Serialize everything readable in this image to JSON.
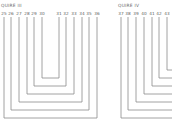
{
  "diagram": {
    "colors": {
      "line": "#8c8c8c",
      "text": "#5e5e5e",
      "background": "#ffffff"
    },
    "quires": [
      {
        "title": "QUIRE III",
        "left_labels": [
          "25",
          "26",
          "27",
          "28",
          "29",
          "30"
        ],
        "right_labels": [
          "31",
          "32",
          "33",
          "34",
          "35",
          "36"
        ],
        "conjugate_pairs": [
          [
            "25",
            "36"
          ],
          [
            "26",
            "35"
          ],
          [
            "27",
            "34"
          ],
          [
            "28",
            "33"
          ],
          [
            "29",
            "32"
          ],
          [
            "30",
            "31"
          ]
        ]
      },
      {
        "title": "QUIRE IV",
        "left_labels": [
          "37",
          "38",
          "39",
          "40",
          "41",
          "42",
          "43"
        ],
        "right_labels": [],
        "note_cropped": true
      }
    ]
  }
}
